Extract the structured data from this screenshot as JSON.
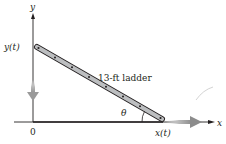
{
  "diagram": {
    "axes": {
      "x_label": "x",
      "y_label": "y",
      "origin_label": "0"
    },
    "labels": {
      "y_position": "y(t)",
      "x_position": "x(t)",
      "ladder": "13-ft ladder",
      "angle": "θ"
    },
    "colors": {
      "axis": "#231f20",
      "ladder_fill": "#bcbec0",
      "ladder_stroke": "#231f20",
      "motion_arrow": "#9a9a9a",
      "text": "#231f20"
    }
  }
}
